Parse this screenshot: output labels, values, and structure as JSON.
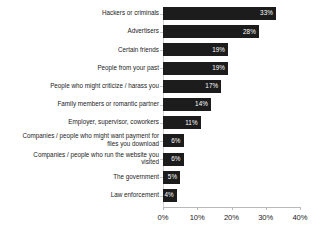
{
  "chart_data": {
    "type": "bar",
    "orientation": "horizontal",
    "title": "",
    "subtitle": "",
    "xlabel": "",
    "ylabel": "",
    "xlim": [
      0,
      40
    ],
    "xticks": [
      0,
      10,
      20,
      30,
      40
    ],
    "xtick_labels": [
      "0%",
      "10%",
      "20%",
      "30%",
      "40%"
    ],
    "grid": false,
    "legend": false,
    "value_suffix": "%",
    "categories": [
      "Hackers or criminals",
      "Advertisers",
      "Certain friends",
      "People from your past",
      "People who might criticize / harass you",
      "Family members or romantic partner",
      "Employer, supervisor, coworkers",
      "Companies / people who might want payment for\nfiles you download",
      "Companies / people who run the website you\nvisited",
      "The government",
      "Law enforcement"
    ],
    "values": [
      33,
      28,
      19,
      19,
      17,
      14,
      11,
      6,
      6,
      5,
      4
    ],
    "value_labels": [
      "33%",
      "28%",
      "19%",
      "19%",
      "17%",
      "14%",
      "11%",
      "6%",
      "6%",
      "5%",
      "4%"
    ],
    "bar_color": "#1c1c1c",
    "value_label_color": "#ffffff",
    "axis_color": "#b9b9b9",
    "text_color": "#1b1b1b",
    "background_color": "#ffffff"
  }
}
